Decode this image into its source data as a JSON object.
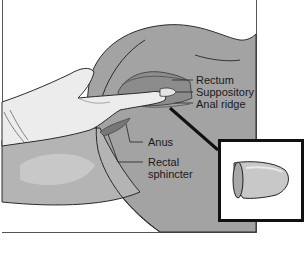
{
  "figure": {
    "colors": {
      "background": "#ffffff",
      "body_dark": "#9a9a9a",
      "body_mid": "#b0b0b0",
      "body_light": "#c9c9c9",
      "glove": "#ececec",
      "outline": "#2a2a2a",
      "inset_border": "#111111"
    },
    "labels": [
      {
        "id": "rectum",
        "text": "Rectum"
      },
      {
        "id": "suppository",
        "text": "Suppository"
      },
      {
        "id": "anal-ridge",
        "text": "Anal ridge"
      },
      {
        "id": "anus",
        "text": "Anus"
      },
      {
        "id": "rectal-sphincter-1",
        "text": "Rectal"
      },
      {
        "id": "rectal-sphincter-2",
        "text": "sphincter"
      }
    ],
    "inset": {
      "depicts": "suppository-closeup"
    }
  }
}
